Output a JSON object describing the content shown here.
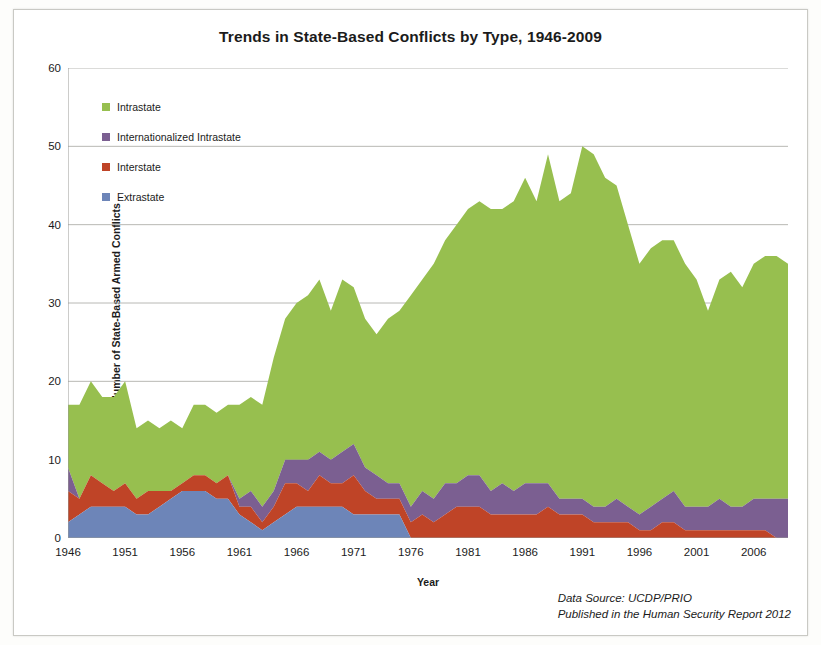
{
  "title": "Trends in State-Based Conflicts by Type, 1946-2009",
  "axes": {
    "xlabel": "Year",
    "ylabel": "Number of State-Based Armed Conflicts",
    "yticks": [
      0,
      10,
      20,
      30,
      40,
      50,
      60
    ],
    "xticks": [
      1946,
      1951,
      1956,
      1961,
      1966,
      1971,
      1976,
      1981,
      1986,
      1991,
      1996,
      2001,
      2006
    ]
  },
  "legend": [
    {
      "label": "Intrastate",
      "color": "#97bf4f"
    },
    {
      "label": "Internationalized Intrastate",
      "color": "#7b5f91"
    },
    {
      "label": "Interstate",
      "color": "#bf4427"
    },
    {
      "label": "Extrastate",
      "color": "#6d85b8"
    }
  ],
  "source": {
    "line1": "Data Source: UCDP/PRIO",
    "line2": "Published in the Human Security Report 2012"
  },
  "chart_data": {
    "type": "area",
    "title": "Trends in State-Based Conflicts by Type, 1946-2009",
    "xlabel": "Year",
    "ylabel": "Number of State-Based Armed Conflicts",
    "xlim": [
      1946,
      2009
    ],
    "ylim": [
      0,
      60
    ],
    "grid": "horizontal",
    "legend_position": "inside-top-left",
    "stacked": true,
    "stack_order_bottom_to_top": [
      "Extrastate",
      "Interstate",
      "Internationalized Intrastate",
      "Intrastate"
    ],
    "x": [
      1946,
      1947,
      1948,
      1949,
      1950,
      1951,
      1952,
      1953,
      1954,
      1955,
      1956,
      1957,
      1958,
      1959,
      1960,
      1961,
      1962,
      1963,
      1964,
      1965,
      1966,
      1967,
      1968,
      1969,
      1970,
      1971,
      1972,
      1973,
      1974,
      1975,
      1976,
      1977,
      1978,
      1979,
      1980,
      1981,
      1982,
      1983,
      1984,
      1985,
      1986,
      1987,
      1988,
      1989,
      1990,
      1991,
      1992,
      1993,
      1994,
      1995,
      1996,
      1997,
      1998,
      1999,
      2000,
      2001,
      2002,
      2003,
      2004,
      2005,
      2006,
      2007,
      2008,
      2009
    ],
    "series": [
      {
        "name": "Extrastate",
        "color": "#6d85b8",
        "values": [
          2,
          3,
          4,
          4,
          4,
          4,
          3,
          3,
          4,
          5,
          6,
          6,
          6,
          5,
          5,
          3,
          2,
          1,
          2,
          3,
          4,
          4,
          4,
          4,
          4,
          3,
          3,
          3,
          3,
          3,
          0,
          0,
          0,
          0,
          0,
          0,
          0,
          0,
          0,
          0,
          0,
          0,
          0,
          0,
          0,
          0,
          0,
          0,
          0,
          0,
          0,
          0,
          0,
          0,
          0,
          0,
          0,
          0,
          0,
          0,
          0,
          0,
          0,
          0
        ]
      },
      {
        "name": "Interstate",
        "color": "#bf4427",
        "values": [
          4,
          2,
          4,
          3,
          2,
          3,
          2,
          3,
          2,
          1,
          1,
          2,
          2,
          2,
          3,
          1,
          2,
          1,
          2,
          4,
          3,
          2,
          4,
          3,
          3,
          5,
          3,
          2,
          2,
          2,
          2,
          3,
          2,
          3,
          4,
          4,
          4,
          3,
          3,
          3,
          3,
          3,
          4,
          3,
          3,
          3,
          2,
          2,
          2,
          2,
          1,
          1,
          2,
          2,
          1,
          1,
          1,
          1,
          1,
          1,
          1,
          1,
          0,
          0
        ]
      },
      {
        "name": "Internationalized Intrastate",
        "color": "#7b5f91",
        "values": [
          3,
          0,
          0,
          0,
          0,
          0,
          0,
          0,
          0,
          0,
          0,
          0,
          0,
          0,
          0,
          1,
          2,
          2,
          2,
          3,
          3,
          4,
          3,
          3,
          4,
          4,
          3,
          3,
          2,
          2,
          2,
          3,
          3,
          4,
          3,
          4,
          4,
          3,
          4,
          3,
          4,
          4,
          3,
          2,
          2,
          2,
          2,
          2,
          3,
          2,
          2,
          3,
          3,
          4,
          3,
          3,
          3,
          4,
          3,
          3,
          4,
          4,
          5,
          5
        ]
      },
      {
        "name": "Intrastate",
        "color": "#97bf4f",
        "values": [
          8,
          12,
          12,
          11,
          12,
          13,
          9,
          9,
          8,
          9,
          7,
          9,
          9,
          9,
          9,
          12,
          12,
          13,
          17,
          18,
          20,
          21,
          22,
          19,
          22,
          20,
          19,
          18,
          21,
          22,
          27,
          27,
          30,
          31,
          33,
          34,
          35,
          36,
          35,
          37,
          39,
          36,
          42,
          38,
          39,
          45,
          45,
          42,
          40,
          36,
          32,
          33,
          33,
          32,
          31,
          29,
          25,
          28,
          30,
          28,
          30,
          31,
          31,
          30
        ]
      }
    ],
    "totals": [
      17,
      17,
      20,
      18,
      18,
      20,
      14,
      15,
      14,
      15,
      14,
      17,
      17,
      16,
      17,
      17,
      18,
      17,
      23,
      28,
      30,
      31,
      33,
      29,
      33,
      32,
      28,
      26,
      28,
      29,
      31,
      33,
      35,
      38,
      40,
      42,
      43,
      42,
      42,
      43,
      46,
      43,
      49,
      43,
      44,
      50,
      49,
      46,
      45,
      40,
      35,
      37,
      38,
      38,
      35,
      33,
      29,
      33,
      34,
      32,
      35,
      36,
      36,
      35
    ]
  }
}
